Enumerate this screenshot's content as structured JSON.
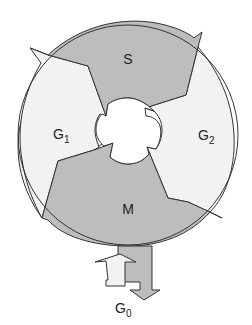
{
  "diagram": {
    "phases": [
      {
        "id": "s",
        "label": "S",
        "sub": ""
      },
      {
        "id": "g2",
        "label": "G",
        "sub": "2"
      },
      {
        "id": "m",
        "label": "M",
        "sub": ""
      },
      {
        "id": "g1",
        "label": "G",
        "sub": "1"
      }
    ],
    "exit_phase": {
      "label": "G",
      "sub": "0"
    },
    "colors": {
      "dark_phase": "#bdbdbd",
      "light_phase": "#f2f2f2",
      "stroke": "#333333",
      "background": "#ffffff"
    }
  }
}
